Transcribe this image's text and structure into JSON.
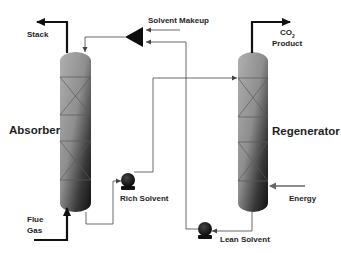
{
  "diagram": {
    "units": {
      "absorber": {
        "label": "Absorber"
      },
      "regenerator": {
        "label": "Regenerator"
      },
      "rich_pump": {
        "label": "Rich Solvent"
      },
      "lean_pump": {
        "label": "Lean Solvent"
      },
      "makeup_mixer": {
        "label": "Solvent Makeup"
      }
    },
    "streams": {
      "stack": {
        "label": "Stack"
      },
      "flue_gas": {
        "line1": "Flue",
        "line2": "Gas"
      },
      "co2_product": {
        "line1_main": "CO",
        "line1_sub": "2",
        "line2": "Product"
      },
      "energy": {
        "label": "Energy"
      }
    },
    "colors": {
      "column_light": "#a8a8a8",
      "column_dark": "#1a1a1a",
      "line": "#555555",
      "thick_line": "#111111",
      "text": "#1e1e1e"
    }
  }
}
